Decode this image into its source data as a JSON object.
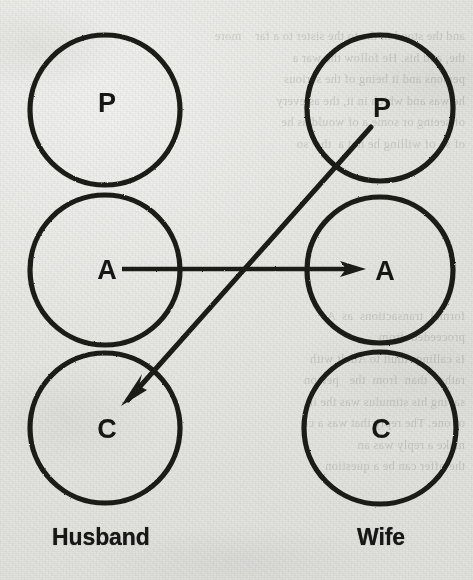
{
  "figure": {
    "type": "transactional-analysis-crossed-transaction",
    "background_color": "#e9e9e7",
    "ink_color": "#1a1a18"
  },
  "columns": [
    {
      "id": "husband",
      "caption": "Husband",
      "caption_x": 105,
      "center_x": 105,
      "ego_states": [
        {
          "id": "parent",
          "letter": "P",
          "cy": 110,
          "r": 75
        },
        {
          "id": "adult",
          "letter": "A",
          "cy": 270,
          "r": 75
        },
        {
          "id": "child",
          "letter": "C",
          "cy": 428,
          "r": 75
        }
      ]
    },
    {
      "id": "wife",
      "caption": "Wife",
      "caption_x": 380,
      "center_x": 380,
      "ego_states": [
        {
          "id": "parent",
          "letter": "P",
          "cy": 108,
          "r": 73
        },
        {
          "id": "adult",
          "letter": "A",
          "cy": 270,
          "r": 73
        },
        {
          "id": "child",
          "letter": "C",
          "cy": 428,
          "r": 76
        }
      ]
    }
  ],
  "transactions": [
    {
      "id": "stimulus",
      "label": "stimulus",
      "direction": "husband-adult-to-wife-adult",
      "from": {
        "x": 122,
        "y": 269
      },
      "to": {
        "x": 366,
        "y": 269
      }
    },
    {
      "id": "response",
      "label": "response",
      "direction": "wife-parent-to-husband-child",
      "from": {
        "x": 371,
        "y": 127
      },
      "to": {
        "x": 121,
        "y": 406
      }
    }
  ],
  "bleed_text": "and the stood in the to the sister to a far    more\nthe, and his. He follow the war a\npersons and it being of the serious\nhe was and which in it, the as every\nof seeing or some a of would as he\nof so of willing he not a  the  so\n\n\n\n\n\n\n\nformal  transactions  as  A\nproceeded  from\nIs calling Adult to Adult with\nrather  than  from  the   person\nsaying his stimulus was the in\nof one. The reply that was a ca\nmake a reply was an\nthe offer can be a question"
}
